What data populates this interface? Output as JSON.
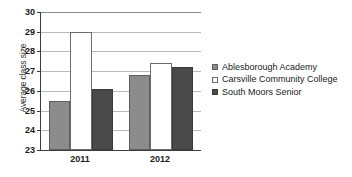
{
  "chart_data": {
    "type": "bar",
    "title": "",
    "subtitle": "",
    "xlabel": "",
    "ylabel": "Average class size",
    "categories": [
      "2011",
      "2012"
    ],
    "ylim": [
      23,
      30
    ],
    "ytick_labels": [
      "23",
      "24",
      "25",
      "26",
      "27",
      "28",
      "29",
      "30"
    ],
    "ytick_values": [
      23,
      24,
      25,
      26,
      27,
      28,
      29,
      30
    ],
    "grid": true,
    "grid_axis": "y",
    "legend_position": "right",
    "series": [
      {
        "name": "Ablesborough Academy",
        "color": "#8c8c8c",
        "values": [
          25.5,
          26.8
        ]
      },
      {
        "name": "Carsville Community College",
        "color": "#ffffff",
        "values": [
          29.0,
          27.4
        ]
      },
      {
        "name": "South Moors Senior",
        "color": "#4a4a4a",
        "values": [
          26.1,
          27.2
        ]
      }
    ]
  }
}
